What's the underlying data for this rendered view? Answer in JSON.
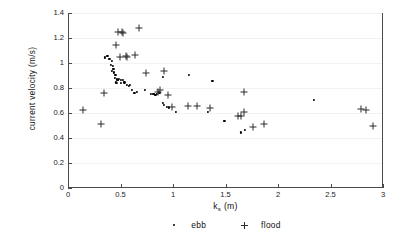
{
  "chart_data": {
    "type": "scatter",
    "title": "",
    "xlabel": "k_s (m)",
    "xlabel_base": "k",
    "xlabel_sub": "s",
    "xlabel_unit": " (m)",
    "ylabel": "current  velocity  (m/s)",
    "xlim": [
      0,
      3
    ],
    "ylim": [
      0,
      1.4
    ],
    "xticks": [
      0,
      0.5,
      1,
      1.5,
      2,
      2.5,
      3
    ],
    "xtick_labels": [
      "0",
      "0.5",
      "1",
      "1.5",
      "2",
      "2.5",
      "3"
    ],
    "yticks": [
      0,
      0.2,
      0.4,
      0.6,
      0.8,
      1,
      1.2,
      1.4
    ],
    "ytick_labels": [
      "0",
      "0.2",
      "0.4",
      "0.6",
      "0.8",
      "1",
      "1.2",
      "1.4"
    ],
    "grid": "faint-horizontal",
    "legend_position": "below-axes-center",
    "marker_colors": {
      "ebb": "#000000",
      "flood": "#2b2b2b"
    },
    "series": [
      {
        "name": "ebb",
        "marker": "dot",
        "points": [
          [
            0.355,
            1.045
          ],
          [
            0.375,
            1.055
          ],
          [
            0.395,
            1.035
          ],
          [
            0.415,
            1.015
          ],
          [
            0.408,
            0.985
          ],
          [
            0.425,
            0.975
          ],
          [
            0.432,
            0.955
          ],
          [
            0.42,
            0.935
          ],
          [
            0.44,
            0.925
          ],
          [
            0.452,
            0.905
          ],
          [
            0.448,
            0.88
          ],
          [
            0.462,
            0.872
          ],
          [
            0.47,
            0.868
          ],
          [
            0.478,
            0.862
          ],
          [
            0.458,
            0.845
          ],
          [
            0.468,
            0.838
          ],
          [
            0.488,
            0.872
          ],
          [
            0.505,
            0.868
          ],
          [
            0.52,
            0.862
          ],
          [
            0.5,
            0.84
          ],
          [
            0.538,
            0.845
          ],
          [
            0.56,
            0.828
          ],
          [
            0.578,
            0.818
          ],
          [
            0.592,
            0.822
          ],
          [
            0.612,
            0.782
          ],
          [
            0.632,
            0.762
          ],
          [
            0.66,
            0.772
          ],
          [
            0.735,
            0.782
          ],
          [
            0.79,
            0.755
          ],
          [
            0.805,
            0.752
          ],
          [
            0.815,
            0.75
          ],
          [
            0.822,
            0.755
          ],
          [
            0.832,
            0.748
          ],
          [
            0.845,
            0.752
          ],
          [
            0.862,
            0.765
          ],
          [
            0.872,
            0.758
          ],
          [
            0.902,
            0.678
          ],
          [
            0.915,
            0.668
          ],
          [
            0.905,
            0.888
          ],
          [
            0.945,
            0.648
          ],
          [
            0.962,
            0.645
          ],
          [
            1.03,
            0.608
          ],
          [
            1.155,
            0.905
          ],
          [
            1.33,
            0.608
          ],
          [
            1.375,
            0.858
          ],
          [
            1.49,
            0.535
          ],
          [
            1.645,
            0.445
          ],
          [
            1.688,
            0.462
          ],
          [
            2.345,
            0.705
          ]
        ]
      },
      {
        "name": "flood",
        "marker": "plus",
        "points": [
          [
            0.145,
            0.628
          ],
          [
            0.318,
            0.512
          ],
          [
            0.342,
            0.762
          ],
          [
            0.458,
            1.148
          ],
          [
            0.478,
            1.248
          ],
          [
            0.498,
            1.045
          ],
          [
            0.512,
            1.248
          ],
          [
            0.525,
            1.238
          ],
          [
            0.552,
            1.055
          ],
          [
            0.565,
            1.052
          ],
          [
            0.642,
            1.068
          ],
          [
            0.678,
            1.282
          ],
          [
            0.742,
            0.918
          ],
          [
            0.855,
            0.772
          ],
          [
            0.872,
            0.782
          ],
          [
            0.912,
            0.938
          ],
          [
            0.948,
            0.742
          ],
          [
            0.995,
            0.645
          ],
          [
            1.142,
            0.658
          ],
          [
            1.228,
            0.655
          ],
          [
            1.352,
            0.642
          ],
          [
            1.618,
            0.578
          ],
          [
            1.648,
            0.575
          ],
          [
            1.678,
            0.608
          ],
          [
            1.672,
            0.765
          ],
          [
            1.758,
            0.488
          ],
          [
            1.868,
            0.512
          ],
          [
            2.795,
            0.632
          ],
          [
            2.838,
            0.628
          ],
          [
            2.905,
            0.495
          ]
        ]
      }
    ],
    "legend": [
      {
        "label": "ebb",
        "marker": "dot"
      },
      {
        "label": "flood",
        "marker": "plus"
      }
    ]
  }
}
